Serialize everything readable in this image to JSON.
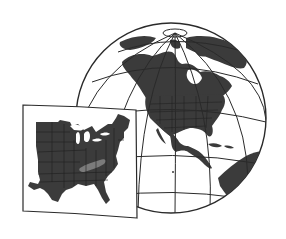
{
  "illustration": {
    "description": "Globe centered on North America with an inset card map of the eastern United States",
    "globe": {
      "center": [
        171,
        118
      ],
      "radius": 95,
      "focus_region": "North America",
      "north_pole": [
        175,
        33
      ]
    },
    "inset": {
      "region": "Eastern United States",
      "highlighted_state": "Kentucky",
      "corners": [
        [
          23,
          105
        ],
        [
          136,
          110
        ],
        [
          137,
          218
        ],
        [
          23,
          211
        ]
      ]
    },
    "colors": {
      "background": "#ffffff",
      "land": "#3b3b3b",
      "highlight": "#7b7b7b",
      "ocean": "#ffffff",
      "lines": "#2a2a2a",
      "state_borders": "#1e1e1e"
    }
  }
}
